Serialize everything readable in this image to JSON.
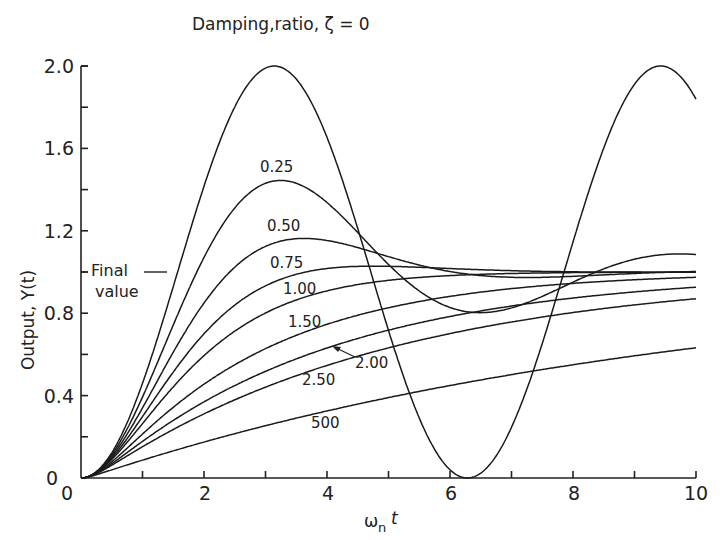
{
  "chart_data": {
    "type": "line",
    "xlabel": "ωn t",
    "ylabel": "Output, Y(t)",
    "xlim": [
      0,
      10
    ],
    "ylim": [
      0,
      2.0
    ],
    "x_ticks": [
      "0",
      "2",
      "4",
      "6",
      "8",
      "10"
    ],
    "y_ticks": [
      "0",
      "0.4",
      "0.8",
      "1.2",
      "1.6",
      "2.0"
    ],
    "grid": false,
    "annotation_final_value": "Final value",
    "final_value": 1.0,
    "series": [
      {
        "name": "0",
        "label": "",
        "zeta": 0.0
      },
      {
        "name": "0.25",
        "label": "0.25",
        "zeta": 0.25
      },
      {
        "name": "0.50",
        "label": "0.50",
        "zeta": 0.5
      },
      {
        "name": "0.75",
        "label": "0.75",
        "zeta": 0.75
      },
      {
        "name": "1.00",
        "label": "1.00",
        "zeta": 1.0
      },
      {
        "name": "1.50",
        "label": "1.50",
        "zeta": 1.5
      },
      {
        "name": "2.00",
        "label": "2.00",
        "zeta": 2.0
      },
      {
        "name": "2.50",
        "label": "2.50",
        "zeta": 2.5
      },
      {
        "name": "5.00",
        "label": "500",
        "zeta": 5.0
      }
    ],
    "peaks": {
      "zeta_0": {
        "x": 3.14,
        "y": 2.0
      },
      "zeta_0.25": {
        "x": 3.24,
        "y": 1.44
      },
      "zeta_0.50": {
        "x": 3.63,
        "y": 1.16
      }
    }
  },
  "labels": {
    "title": "Damping,ratio, ζ = 0",
    "ylabel": "Output, Y(t)",
    "xlabel_main": "ω",
    "xlabel_sub": "n",
    "xlabel_t": "t",
    "final_line1": "Final",
    "final_line2": "value",
    "c025": "0.25",
    "c050": "0.50",
    "c075": "0.75",
    "c100": "1.00",
    "c150": "1.50",
    "c200": "2.00",
    "c250": "2.50",
    "c500": "500"
  },
  "ticks": {
    "x": [
      "0",
      "2",
      "4",
      "6",
      "8",
      "10"
    ],
    "y": [
      "0",
      "0.4",
      "0.8",
      "1.2",
      "1.6",
      "2.0"
    ]
  }
}
